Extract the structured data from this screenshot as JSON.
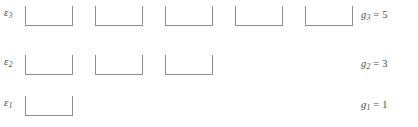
{
  "diagram": {
    "background_color": "#ffffff",
    "stroke_color": "#8d8d8d",
    "text_color": "#4a4a4a",
    "state_box_width": 48,
    "state_box_height": 20,
    "state_box_gap": 22,
    "levels": [
      {
        "id": "level-3",
        "energy_symbol": "ε",
        "energy_subscript": "3",
        "energy_label": "ε3",
        "degeneracy_symbol": "g",
        "degeneracy_subscript": "3",
        "degeneracy_equals": "=",
        "degeneracy_value": "5",
        "degeneracy_label": "g3 = 5",
        "state_count": 5,
        "row_top": 4,
        "box_left_positions": [
          0,
          70,
          140,
          210,
          280
        ]
      },
      {
        "id": "level-2",
        "energy_symbol": "ε",
        "energy_subscript": "2",
        "energy_label": "ε2",
        "degeneracy_symbol": "g",
        "degeneracy_subscript": "2",
        "degeneracy_equals": "=",
        "degeneracy_value": "3",
        "degeneracy_label": "g2 = 3",
        "state_count": 3,
        "row_top": 53,
        "box_left_positions": [
          0,
          70,
          140
        ]
      },
      {
        "id": "level-1",
        "energy_symbol": "ε",
        "energy_subscript": "1",
        "energy_label": "ε1",
        "degeneracy_symbol": "g",
        "degeneracy_subscript": "1",
        "degeneracy_equals": "=",
        "degeneracy_value": "1",
        "degeneracy_label": "g1 = 1",
        "state_count": 1,
        "row_top": 94,
        "box_left_positions": [
          0
        ]
      }
    ]
  }
}
